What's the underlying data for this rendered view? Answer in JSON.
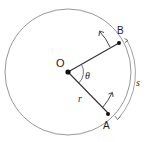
{
  "diagram": {
    "labels": {
      "center": "O",
      "point_b": "B",
      "point_a": "A",
      "angle": "θ",
      "radius": "r",
      "arc_length": "s"
    },
    "colors": {
      "circle": "#8a8a8a",
      "lines": "#333333",
      "points": "#111111",
      "text": "#222222"
    }
  }
}
